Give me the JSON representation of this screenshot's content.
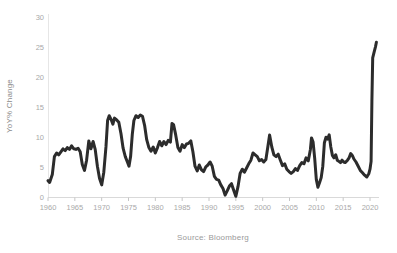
{
  "chart_data": {
    "type": "line",
    "title": "",
    "xlabel": "",
    "ylabel": "YoY% Change",
    "source": "Source: Bloomberg",
    "xlim": [
      1960,
      2022
    ],
    "ylim": [
      0,
      30
    ],
    "grid": false,
    "legend": "none",
    "x_ticks": [
      1960,
      1965,
      1970,
      1975,
      1980,
      1985,
      1990,
      1995,
      2000,
      2005,
      2010,
      2015,
      2020
    ],
    "y_ticks": [
      0,
      5,
      10,
      15,
      20,
      25,
      30
    ],
    "colors": {
      "line": "#2c2c2c",
      "y_axis": "#e6e6e6",
      "x_axis": "#d9d9d9",
      "tick_mark": "#c6c6c6",
      "tick_label": "#a9a9a9",
      "axis_title": "#8a8a8a",
      "source_text": "#9a9a9a",
      "background": "#ffffff"
    },
    "series": [
      {
        "name": "YoY% Change",
        "points": [
          [
            1960.0,
            2.8
          ],
          [
            1960.3,
            2.5
          ],
          [
            1960.8,
            3.8
          ],
          [
            1961.2,
            6.8
          ],
          [
            1961.6,
            7.4
          ],
          [
            1962.0,
            7.1
          ],
          [
            1962.4,
            7.6
          ],
          [
            1962.8,
            8.1
          ],
          [
            1963.2,
            7.8
          ],
          [
            1963.6,
            8.3
          ],
          [
            1964.0,
            8.0
          ],
          [
            1964.4,
            8.6
          ],
          [
            1964.8,
            8.1
          ],
          [
            1965.2,
            8.0
          ],
          [
            1965.6,
            8.2
          ],
          [
            1966.0,
            7.6
          ],
          [
            1966.4,
            5.5
          ],
          [
            1966.8,
            4.5
          ],
          [
            1967.2,
            6.2
          ],
          [
            1967.6,
            9.4
          ],
          [
            1968.0,
            8.1
          ],
          [
            1968.4,
            9.3
          ],
          [
            1968.8,
            8.0
          ],
          [
            1969.2,
            5.2
          ],
          [
            1969.6,
            3.2
          ],
          [
            1970.0,
            2.1
          ],
          [
            1970.4,
            4.2
          ],
          [
            1970.8,
            8.5
          ],
          [
            1971.1,
            12.8
          ],
          [
            1971.4,
            13.6
          ],
          [
            1971.8,
            12.9
          ],
          [
            1972.1,
            12.2
          ],
          [
            1972.4,
            13.2
          ],
          [
            1972.8,
            12.9
          ],
          [
            1973.2,
            12.5
          ],
          [
            1973.6,
            10.6
          ],
          [
            1974.0,
            8.2
          ],
          [
            1974.4,
            6.8
          ],
          [
            1974.8,
            5.9
          ],
          [
            1975.1,
            5.2
          ],
          [
            1975.4,
            6.8
          ],
          [
            1975.7,
            10.5
          ],
          [
            1976.0,
            12.8
          ],
          [
            1976.4,
            13.6
          ],
          [
            1976.8,
            13.3
          ],
          [
            1977.2,
            13.7
          ],
          [
            1977.6,
            13.5
          ],
          [
            1978.0,
            12.0
          ],
          [
            1978.4,
            9.6
          ],
          [
            1978.8,
            8.3
          ],
          [
            1979.2,
            7.7
          ],
          [
            1979.6,
            8.4
          ],
          [
            1980.0,
            7.4
          ],
          [
            1980.4,
            8.3
          ],
          [
            1980.8,
            9.3
          ],
          [
            1981.2,
            8.6
          ],
          [
            1981.6,
            9.3
          ],
          [
            1982.0,
            8.8
          ],
          [
            1982.4,
            9.5
          ],
          [
            1982.8,
            9.2
          ],
          [
            1983.1,
            12.3
          ],
          [
            1983.4,
            12.1
          ],
          [
            1983.8,
            10.4
          ],
          [
            1984.2,
            8.3
          ],
          [
            1984.6,
            7.7
          ],
          [
            1985.0,
            8.8
          ],
          [
            1985.4,
            8.3
          ],
          [
            1985.8,
            8.9
          ],
          [
            1986.2,
            9.0
          ],
          [
            1986.6,
            9.4
          ],
          [
            1987.0,
            7.6
          ],
          [
            1987.4,
            5.2
          ],
          [
            1987.8,
            4.4
          ],
          [
            1988.2,
            5.4
          ],
          [
            1988.6,
            4.6
          ],
          [
            1989.0,
            4.3
          ],
          [
            1989.4,
            5.1
          ],
          [
            1989.8,
            5.4
          ],
          [
            1990.2,
            5.9
          ],
          [
            1990.6,
            5.2
          ],
          [
            1991.0,
            3.5
          ],
          [
            1991.4,
            3.0
          ],
          [
            1991.8,
            2.9
          ],
          [
            1992.2,
            2.1
          ],
          [
            1992.6,
            1.5
          ],
          [
            1993.0,
            0.4
          ],
          [
            1993.4,
            1.1
          ],
          [
            1993.8,
            1.9
          ],
          [
            1994.2,
            2.3
          ],
          [
            1994.6,
            1.2
          ],
          [
            1995.0,
            0.2
          ],
          [
            1995.4,
            1.8
          ],
          [
            1995.8,
            4.0
          ],
          [
            1996.2,
            4.7
          ],
          [
            1996.6,
            4.2
          ],
          [
            1997.0,
            4.9
          ],
          [
            1997.4,
            5.6
          ],
          [
            1997.8,
            6.2
          ],
          [
            1998.2,
            7.4
          ],
          [
            1998.6,
            7.1
          ],
          [
            1999.0,
            6.8
          ],
          [
            1999.4,
            6.1
          ],
          [
            1999.8,
            6.3
          ],
          [
            2000.2,
            5.9
          ],
          [
            2000.6,
            6.3
          ],
          [
            2001.0,
            8.6
          ],
          [
            2001.3,
            10.4
          ],
          [
            2001.7,
            8.4
          ],
          [
            2002.1,
            7.1
          ],
          [
            2002.5,
            6.8
          ],
          [
            2002.9,
            7.2
          ],
          [
            2003.3,
            6.2
          ],
          [
            2003.7,
            5.3
          ],
          [
            2004.1,
            5.6
          ],
          [
            2004.5,
            4.7
          ],
          [
            2004.9,
            4.3
          ],
          [
            2005.3,
            4.0
          ],
          [
            2005.7,
            4.3
          ],
          [
            2006.1,
            4.8
          ],
          [
            2006.5,
            4.5
          ],
          [
            2006.9,
            5.3
          ],
          [
            2007.3,
            5.8
          ],
          [
            2007.7,
            5.6
          ],
          [
            2008.1,
            6.6
          ],
          [
            2008.5,
            6.1
          ],
          [
            2008.9,
            8.0
          ],
          [
            2009.1,
            9.9
          ],
          [
            2009.4,
            9.2
          ],
          [
            2009.7,
            6.5
          ],
          [
            2010.0,
            3.0
          ],
          [
            2010.3,
            1.7
          ],
          [
            2010.6,
            2.5
          ],
          [
            2010.9,
            3.3
          ],
          [
            2011.2,
            5.2
          ],
          [
            2011.5,
            9.1
          ],
          [
            2011.8,
            10.0
          ],
          [
            2012.1,
            9.7
          ],
          [
            2012.4,
            10.4
          ],
          [
            2012.7,
            8.4
          ],
          [
            2013.0,
            7.0
          ],
          [
            2013.3,
            6.6
          ],
          [
            2013.6,
            7.1
          ],
          [
            2013.9,
            6.2
          ],
          [
            2014.2,
            6.0
          ],
          [
            2014.5,
            5.8
          ],
          [
            2014.8,
            6.2
          ],
          [
            2015.1,
            5.9
          ],
          [
            2015.4,
            5.8
          ],
          [
            2015.8,
            6.2
          ],
          [
            2016.1,
            6.6
          ],
          [
            2016.4,
            7.3
          ],
          [
            2016.7,
            7.0
          ],
          [
            2017.0,
            6.4
          ],
          [
            2017.4,
            5.9
          ],
          [
            2017.8,
            5.2
          ],
          [
            2018.2,
            4.5
          ],
          [
            2018.6,
            4.1
          ],
          [
            2019.0,
            3.7
          ],
          [
            2019.4,
            3.4
          ],
          [
            2019.8,
            4.0
          ],
          [
            2020.0,
            4.7
          ],
          [
            2020.2,
            6.0
          ],
          [
            2020.35,
            16.0
          ],
          [
            2020.5,
            23.2
          ],
          [
            2020.8,
            24.3
          ],
          [
            2021.0,
            25.0
          ],
          [
            2021.2,
            25.8
          ]
        ]
      }
    ]
  }
}
